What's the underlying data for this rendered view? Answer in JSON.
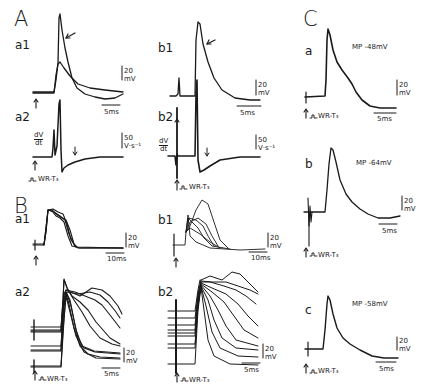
{
  "figure": {
    "panels": {
      "A": {
        "letter": "A",
        "a1": {
          "label": "a1",
          "scale_v": "20",
          "scale_v_unit": "mV",
          "scale_t": "5ms"
        },
        "a2": {
          "label": "a2",
          "dvdt_num": "dV",
          "dvdt_den": "dt",
          "scale_v": "50",
          "scale_v_unit": "V·s⁻¹",
          "stim": "WR-T₃"
        },
        "b1": {
          "label": "b1",
          "scale_v": "20",
          "scale_v_unit": "mV",
          "scale_t": "5ms"
        },
        "b2": {
          "label": "b2",
          "dvdt_num": "dV",
          "dvdt_den": "dt",
          "scale_v": "50",
          "scale_v_unit": "V·s⁻¹",
          "stim": "WR-T₃"
        }
      },
      "B": {
        "letter": "B",
        "a1": {
          "label": "a1",
          "scale_v": "20",
          "scale_v_unit": "mV",
          "scale_t": "10ms"
        },
        "a2": {
          "label": "a2",
          "scale_v": "20",
          "scale_v_unit": "mV",
          "scale_t": "5ms",
          "stim": "WR-T₃"
        },
        "b1": {
          "label": "b1",
          "scale_v": "20",
          "scale_v_unit": "mV",
          "scale_t": "10ms"
        },
        "b2": {
          "label": "b2",
          "scale_v": "20",
          "scale_v_unit": "mV",
          "scale_t": "5ms",
          "stim": "WR-T₃"
        }
      },
      "C": {
        "letter": "C",
        "a": {
          "label": "a",
          "mp": "MP -48mV",
          "scale_v": "20",
          "scale_v_unit": "mV",
          "scale_t": "5ms",
          "stim": "WR-T₃"
        },
        "b": {
          "label": "b",
          "mp": "MP -64mV",
          "scale_v": "20",
          "scale_v_unit": "mV",
          "scale_t": "5ms",
          "stim": "WR-T₃"
        },
        "c": {
          "label": "c",
          "mp": "MP -58mV",
          "scale_v": "20",
          "scale_v_unit": "mV",
          "scale_t": "5ms",
          "stim": "WR-T₃"
        }
      }
    },
    "colors": {
      "ink": "#1a1a1a",
      "background": "#ffffff"
    }
  }
}
